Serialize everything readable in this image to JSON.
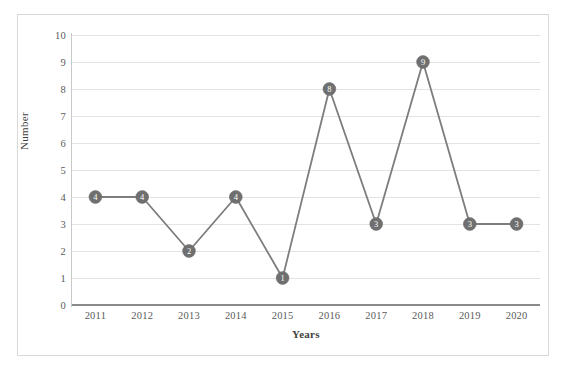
{
  "chart_data": {
    "type": "line",
    "title": "",
    "xlabel": "Years",
    "ylabel": "Number",
    "categories": [
      "2011",
      "2012",
      "2013",
      "2014",
      "2015",
      "2016",
      "2017",
      "2018",
      "2019",
      "2020"
    ],
    "values": [
      4,
      4,
      2,
      4,
      1,
      8,
      3,
      9,
      3,
      3
    ],
    "point_labels": [
      "4",
      "4",
      "2",
      "4",
      "1",
      "8",
      "3",
      "9",
      "3",
      "3"
    ],
    "ylim": [
      0,
      10
    ],
    "yticks": [
      "0",
      "1",
      "2",
      "3",
      "4",
      "5",
      "6",
      "7",
      "8",
      "9",
      "10"
    ],
    "grid": true,
    "legend": "none",
    "series_color": "#7d7d7d",
    "marker_color": "#6f6f6f",
    "marker_label_color": "#ffffff",
    "gridline_color": "#e3e3e3",
    "axis_color": "#8a8a8a",
    "text_color": "#5a5a5a",
    "background_color": "#ffffff",
    "border_color": "#d8d8d8"
  }
}
